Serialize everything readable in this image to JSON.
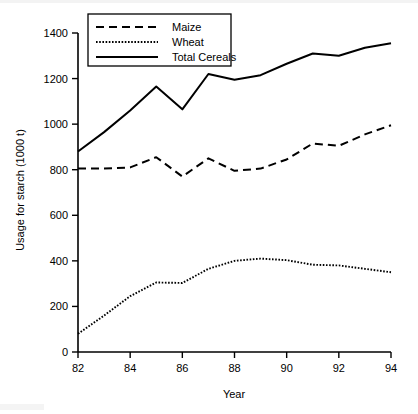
{
  "chart_data": {
    "type": "line",
    "title": "",
    "subtitle": "",
    "xlabel": "Year",
    "ylabel": "Usage for starch (1000 t)",
    "xlim": [
      82,
      94
    ],
    "ylim": [
      0,
      1400
    ],
    "grid": false,
    "legend_position": "top-left",
    "x": [
      82,
      83,
      84,
      85,
      86,
      87,
      88,
      89,
      90,
      91,
      92,
      93,
      94
    ],
    "xticks": [
      "82",
      "84",
      "86",
      "88",
      "90",
      "92",
      "94"
    ],
    "xtick_values": [
      82,
      84,
      86,
      88,
      90,
      92,
      94
    ],
    "yticks": [
      "0",
      "200",
      "400",
      "600",
      "800",
      "1000",
      "1200",
      "1400"
    ],
    "ytick_values": [
      0,
      200,
      400,
      600,
      800,
      1000,
      1200,
      1400
    ],
    "series": [
      {
        "name": "Maize",
        "style": "dashed",
        "values": [
          805,
          805,
          810,
          855,
          770,
          850,
          795,
          805,
          845,
          915,
          905,
          955,
          995
        ]
      },
      {
        "name": "Wheat",
        "style": "dotted",
        "values": [
          80,
          160,
          245,
          305,
          303,
          365,
          400,
          410,
          403,
          383,
          380,
          365,
          350
        ]
      },
      {
        "name": "Total Cereals",
        "style": "solid",
        "values": [
          880,
          965,
          1060,
          1165,
          1065,
          1220,
          1195,
          1215,
          1265,
          1310,
          1300,
          1335,
          1355
        ]
      }
    ]
  },
  "legend": {
    "entries": [
      {
        "label": "Maize",
        "style": "dashed"
      },
      {
        "label": "Wheat",
        "style": "dotted"
      },
      {
        "label": "Total Cereals",
        "style": "solid"
      }
    ]
  },
  "axes": {
    "x_title": "Year",
    "y_title": "Usage for starch (1000 t)"
  }
}
